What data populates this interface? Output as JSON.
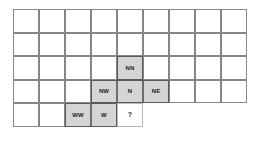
{
  "figure": {
    "name": "direction-grid",
    "grid": {
      "columns": 9,
      "rows": 5,
      "cell_width": 26,
      "cell_height": 23.5,
      "origin_x": 13,
      "origin_y": 9,
      "row_widths": [
        9,
        9,
        9,
        9,
        5
      ],
      "line_color": "#868686",
      "background_color": "#ffffff"
    },
    "colors": {
      "shaded_fill": "#d5d5d5",
      "shaded_border": "#6d6d6d",
      "plain_fill": "#ffffff",
      "query_border": "#b9b9b9",
      "outline": "#5a5a5a",
      "label_text": "#1c1c1c"
    },
    "cells": [
      {
        "id": "cell-nn",
        "label": "NN",
        "row": 3,
        "col": 5,
        "state": "shaded"
      },
      {
        "id": "cell-nw",
        "label": "NW",
        "row": 4,
        "col": 4,
        "state": "shaded"
      },
      {
        "id": "cell-n",
        "label": "N",
        "row": 4,
        "col": 5,
        "state": "shaded"
      },
      {
        "id": "cell-ne",
        "label": "NE",
        "row": 4,
        "col": 6,
        "state": "shaded"
      },
      {
        "id": "cell-ww",
        "label": "WW",
        "row": 5,
        "col": 3,
        "state": "shaded"
      },
      {
        "id": "cell-w",
        "label": "W",
        "row": 5,
        "col": 4,
        "state": "shaded"
      },
      {
        "id": "cell-query",
        "label": "?",
        "row": 5,
        "col": 5,
        "state": "query"
      }
    ]
  }
}
